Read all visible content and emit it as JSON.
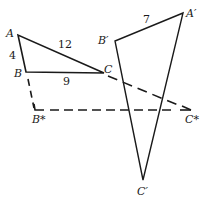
{
  "diagram": {
    "type": "geometry",
    "colors": {
      "stroke": "#1a1a1a",
      "background": "#ffffff"
    },
    "labels": {
      "A": "A",
      "B": "B",
      "C": "C",
      "A_prime": "A′",
      "B_prime": "B′",
      "C_prime": "C′",
      "B_star": "B*",
      "C_star": "C*"
    },
    "side_lengths": {
      "AB": "4",
      "AC": "12",
      "BC": "9",
      "A_prime_B_prime": "7"
    }
  }
}
